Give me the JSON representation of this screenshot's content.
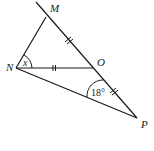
{
  "diagram": {
    "type": "geometry-triangle",
    "points": {
      "M": {
        "label": "M"
      },
      "N": {
        "label": "N"
      },
      "O": {
        "label": "O"
      },
      "P": {
        "label": "P"
      }
    },
    "angles": {
      "at_N": {
        "label": "x"
      },
      "at_O": {
        "label": "18°"
      }
    },
    "segments": [
      "MP (extended through M)",
      "MN",
      "NO",
      "NP"
    ],
    "equal_marks": [
      "MO",
      "NO",
      "OP"
    ],
    "line_color": "#1a1a1a"
  }
}
